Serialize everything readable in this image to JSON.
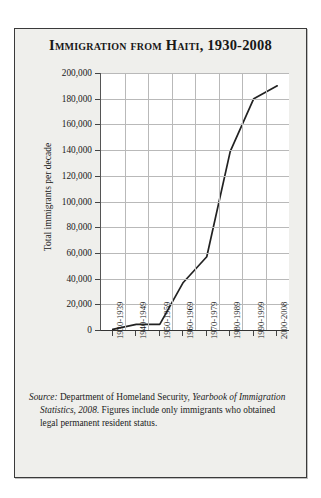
{
  "figure": {
    "title": "Immigration from Haiti, 1930-2008",
    "source_prefix": "Source:",
    "source_text": " Department of Homeland Security, ",
    "source_italic": "Yearbook of Immigration Statistics, 2008",
    "source_rest": ". Figures include only immigrants who obtained legal permanent resident status.",
    "source_full": "Source: Department of Homeland Security, Yearbook of Immigration Statistics, 2008. Figures include only immigrants who obtained legal permanent resident status.",
    "panel_bg": "#efefec",
    "border_color": "#3a3a3a",
    "line_color": "#222222",
    "grid_color": "#b9b9b9"
  },
  "chart_data": {
    "type": "line",
    "title": "Immigration from Haiti, 1930-2008",
    "xlabel": "",
    "ylabel": "Total immigrants per decade",
    "categories": [
      "1930-1939",
      "1940-1949",
      "1950-1959",
      "1960-1969",
      "1970-1979",
      "1980-1989",
      "1990-1999",
      "2000-2008"
    ],
    "values": [
      500,
      4400,
      4400,
      37000,
      57000,
      139000,
      180000,
      190000
    ],
    "ylim": [
      0,
      200000
    ],
    "ytick_values": [
      0,
      20000,
      40000,
      60000,
      80000,
      100000,
      120000,
      140000,
      160000,
      180000,
      200000
    ],
    "ytick_labels": [
      "0",
      "20,000",
      "40,000",
      "60,000",
      "80,000",
      "100,000",
      "120,000",
      "140,000",
      "160,000",
      "180,000",
      "200,000"
    ],
    "grid": true,
    "legend": false,
    "series": [
      {
        "name": "Total immigrants per decade",
        "values": [
          500,
          4400,
          4400,
          37000,
          57000,
          139000,
          180000,
          190000
        ]
      }
    ]
  }
}
